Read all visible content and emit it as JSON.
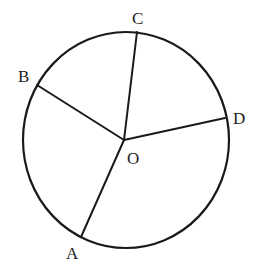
{
  "diagram": {
    "type": "circle-with-radii",
    "center": {
      "label": "O",
      "x": 124,
      "y": 140
    },
    "circle": {
      "cx": 126,
      "cy": 140,
      "rx": 103,
      "ry": 108,
      "stroke": "#1a1a1a",
      "stroke_width": 2.2
    },
    "points": [
      {
        "id": "A",
        "label": "A",
        "x": 81,
        "y": 237,
        "label_x": 66,
        "label_y": 259
      },
      {
        "id": "B",
        "label": "B",
        "x": 37,
        "y": 85,
        "label_x": 18,
        "label_y": 82
      },
      {
        "id": "C",
        "label": "C",
        "x": 137,
        "y": 32,
        "label_x": 132,
        "label_y": 24
      },
      {
        "id": "D",
        "label": "D",
        "x": 225,
        "y": 118,
        "label_x": 233,
        "label_y": 124
      }
    ],
    "radii": [
      "OA",
      "OB",
      "OC",
      "OD"
    ],
    "center_label_pos": {
      "x": 127,
      "y": 164
    }
  }
}
